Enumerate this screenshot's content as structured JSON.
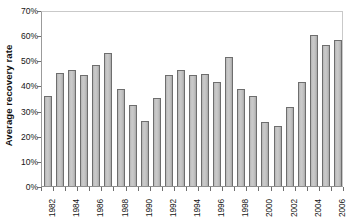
{
  "chart_data": {
    "type": "bar",
    "title": "",
    "xlabel": "",
    "ylabel": "Average recovery rate",
    "ylim": [
      0,
      70
    ],
    "ytick_labels": [
      "0%",
      "10%",
      "20%",
      "30%",
      "40%",
      "50%",
      "60%",
      "70%"
    ],
    "ytick_values": [
      0,
      10,
      20,
      30,
      40,
      50,
      60,
      70
    ],
    "grid": false,
    "legend": null,
    "value_suffix": "%",
    "categories": [
      "1982",
      "1983",
      "1984",
      "1985",
      "1986",
      "1987",
      "1988",
      "1989",
      "1990",
      "1991",
      "1992",
      "1993",
      "1994",
      "1995",
      "1996",
      "1997",
      "1998",
      "1999",
      "2000",
      "2001",
      "2002",
      "2003",
      "2004",
      "2005",
      "2006"
    ],
    "visible_tick_labels": [
      "1982",
      "",
      "1984",
      "",
      "1986",
      "",
      "1988",
      "",
      "1990",
      "",
      "1992",
      "",
      "1994",
      "",
      "1996",
      "",
      "1998",
      "",
      "2000",
      "",
      "2002",
      "",
      "2004",
      "",
      "2006"
    ],
    "values": [
      35.8,
      44.8,
      46.3,
      44.2,
      48.0,
      53.0,
      38.4,
      32.2,
      26.0,
      35.0,
      44.1,
      46.0,
      44.2,
      44.4,
      41.5,
      51.2,
      38.5,
      36.0,
      25.5,
      24.0,
      31.3,
      41.5,
      60.0,
      56.0,
      58.0
    ]
  },
  "caption": {
    "text": ""
  }
}
